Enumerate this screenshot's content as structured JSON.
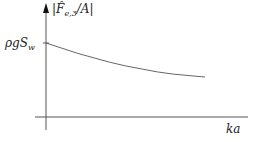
{
  "chart_data": {
    "type": "line",
    "title": "",
    "xlabel": "ka",
    "ylabel": "|F̂e,3/A|",
    "y_tick_labels": [
      "ρgS_w"
    ],
    "grid": false,
    "legend": null,
    "series": [
      {
        "name": "|F̂e,3/A|",
        "description": "monotonically decreasing curve starting at ρgS_w at ka=0",
        "x": [
          0,
          0.1,
          0.2,
          0.3,
          0.4,
          0.5,
          0.6,
          0.7,
          0.8,
          0.9,
          1.0
        ],
        "y": [
          1.0,
          0.93,
          0.86,
          0.8,
          0.74,
          0.69,
          0.65,
          0.61,
          0.58,
          0.56,
          0.54
        ]
      }
    ],
    "axis_color": "#555555",
    "curve_color": "#666666"
  },
  "labels": {
    "y_axis": "|F̂",
    "y_axis_sub": "e,3",
    "y_axis_tail": "/A|",
    "y_tick": "ρgS",
    "y_tick_sub": "w",
    "x_axis": "ka"
  }
}
